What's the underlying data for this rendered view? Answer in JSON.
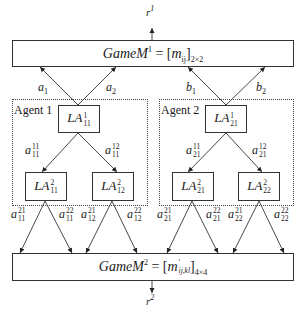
{
  "diagram": {
    "top_game": {
      "name": "GameM",
      "superscript": "1",
      "matrix_entry": "m",
      "matrix_index": "ij",
      "dimension": "2×2",
      "output": {
        "symbol": "r",
        "superscript": "1"
      }
    },
    "bottom_game": {
      "name": "GameM",
      "superscript": "2",
      "matrix_entry": "m",
      "matrix_prime": "′",
      "matrix_index": "ij,kl",
      "dimension": "4×4",
      "output": {
        "symbol": "r",
        "superscript": "2"
      }
    },
    "agents": [
      {
        "label": "Agent 1",
        "root": {
          "name": "LA",
          "sup": "1",
          "sub": "11"
        },
        "top_actions": [
          {
            "sym": "a",
            "sub": "1"
          },
          {
            "sym": "a",
            "sub": "2"
          }
        ],
        "mid_actions": [
          {
            "sym": "a",
            "sup": "11",
            "sub": "11"
          },
          {
            "sym": "a",
            "sup": "12",
            "sub": "11"
          }
        ],
        "children": [
          {
            "name": "LA",
            "sup": "2",
            "sub": "11",
            "actions": [
              {
                "sym": "a",
                "sup": "21",
                "sub": "11"
              },
              {
                "sym": "a",
                "sup": "22",
                "sub": "11"
              }
            ]
          },
          {
            "name": "LA",
            "sup": "2",
            "sub": "12",
            "actions": [
              {
                "sym": "a",
                "sup": "21",
                "sub": "12"
              },
              {
                "sym": "a",
                "sup": "22",
                "sub": "12"
              }
            ]
          }
        ]
      },
      {
        "label": "Agent 2",
        "root": {
          "name": "LA",
          "sup": "1",
          "sub": "21"
        },
        "top_actions": [
          {
            "sym": "b",
            "sub": "1"
          },
          {
            "sym": "b",
            "sub": "2"
          }
        ],
        "mid_actions": [
          {
            "sym": "a",
            "sup": "11",
            "sub": "21"
          },
          {
            "sym": "a",
            "sup": "12",
            "sub": "21"
          }
        ],
        "children": [
          {
            "name": "LA",
            "sup": "2",
            "sub": "21",
            "actions": [
              {
                "sym": "a",
                "sup": "21",
                "sub": "21"
              },
              {
                "sym": "a",
                "sup": "22",
                "sub": "21"
              }
            ]
          },
          {
            "name": "LA",
            "sup": "2",
            "sub": "22",
            "actions": [
              {
                "sym": "a",
                "sup": "21",
                "sub": "22"
              },
              {
                "sym": "a",
                "sup": "22",
                "sub": "22"
              }
            ]
          }
        ]
      }
    ],
    "colors": {
      "line": "#333333",
      "text": "#1a1a1a",
      "background": "#ffffff"
    }
  }
}
